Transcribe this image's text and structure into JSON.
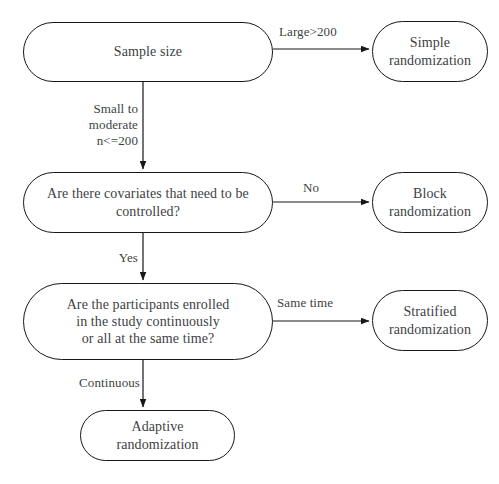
{
  "diagram": {
    "stroke_color": "#15171a",
    "text_color": "#3d3f44",
    "background_color": "#ffffff",
    "nodes": [
      {
        "id": "sample-size",
        "label": "Sample size",
        "shape": "stadium",
        "x": 23,
        "y": 22,
        "w": 250,
        "h": 60,
        "font_size": 14
      },
      {
        "id": "simple-randomization",
        "label": "Simple\nrandomization",
        "shape": "stadium",
        "x": 372,
        "y": 21,
        "w": 116,
        "h": 61,
        "font_size": 14
      },
      {
        "id": "covariates-question",
        "label": "Are there covariates that need to be\ncontrolled?",
        "shape": "stadium",
        "x": 23,
        "y": 172,
        "w": 250,
        "h": 61,
        "font_size": 14
      },
      {
        "id": "block-randomization",
        "label": "Block\nrandomization",
        "shape": "stadium",
        "x": 372,
        "y": 172,
        "w": 116,
        "h": 61,
        "font_size": 14
      },
      {
        "id": "enrollment-question",
        "label": "Are the participants enrolled\nin the study continuously\nor all at the same time?",
        "shape": "stadium",
        "x": 23,
        "y": 283,
        "w": 250,
        "h": 77,
        "font_size": 14
      },
      {
        "id": "stratified-randomization",
        "label": "Stratified\nrandomization",
        "shape": "stadium",
        "x": 372,
        "y": 290,
        "w": 116,
        "h": 61,
        "font_size": 14
      },
      {
        "id": "adaptive-randomization",
        "label": "Adaptive\nrandomization",
        "shape": "stadium",
        "x": 80,
        "y": 410,
        "w": 155,
        "h": 51,
        "font_size": 14
      }
    ],
    "edges": [
      {
        "id": "edge-large",
        "from": "sample-size",
        "to": "simple-randomization",
        "label": "Large>200",
        "label_x": 279,
        "label_y": 24,
        "label_w": 84,
        "label_align": "left",
        "font_size": 13
      },
      {
        "id": "edge-small-moderate",
        "from": "sample-size",
        "to": "covariates-question",
        "label": "Small to\nmoderate\nn<=200",
        "label_x": 60,
        "label_y": 101,
        "label_w": 78,
        "label_align": "right",
        "font_size": 13
      },
      {
        "id": "edge-no",
        "from": "covariates-question",
        "to": "block-randomization",
        "label": "No",
        "label_x": 303,
        "label_y": 180,
        "label_w": 38,
        "label_align": "left",
        "font_size": 13
      },
      {
        "id": "edge-yes",
        "from": "covariates-question",
        "to": "enrollment-question",
        "label": "Yes",
        "label_x": 104,
        "label_y": 250,
        "label_w": 34,
        "label_align": "right",
        "font_size": 13
      },
      {
        "id": "edge-same-time",
        "from": "enrollment-question",
        "to": "stratified-randomization",
        "label": "Same time",
        "label_x": 277,
        "label_y": 295,
        "label_w": 80,
        "label_align": "left",
        "font_size": 13
      },
      {
        "id": "edge-continuous",
        "from": "enrollment-question",
        "to": "adaptive-randomization",
        "label": "Continuous",
        "label_x": 60,
        "label_y": 375,
        "label_w": 80,
        "label_align": "right",
        "font_size": 13
      }
    ],
    "connector_paths": [
      {
        "id": "path-large",
        "d": "M 273 49 L 369 49",
        "arrow": true
      },
      {
        "id": "path-small",
        "d": "M 143 82 L 143 169",
        "arrow": true
      },
      {
        "id": "path-no",
        "d": "M 273 202 L 369 202",
        "arrow": true
      },
      {
        "id": "path-yes",
        "d": "M 143 233 L 143 280",
        "arrow": true
      },
      {
        "id": "path-same-time",
        "d": "M 273 321 L 369 321",
        "arrow": true
      },
      {
        "id": "path-continuous",
        "d": "M 143 360 L 143 407",
        "arrow": true
      }
    ]
  }
}
